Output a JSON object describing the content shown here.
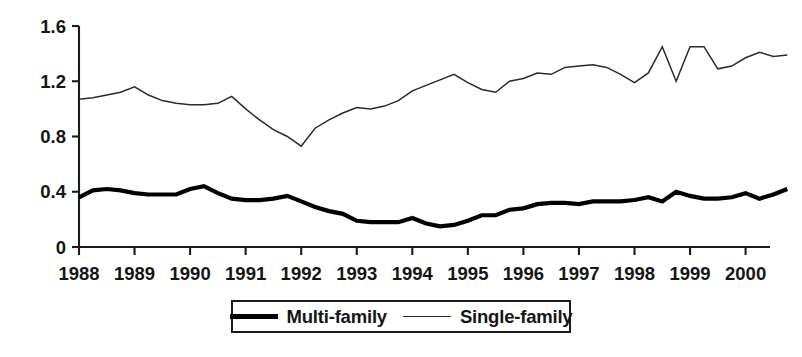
{
  "chart_data": {
    "type": "line",
    "title": "",
    "subtitle": "",
    "xlabel": "",
    "ylabel": "",
    "xlim": [
      1988.0,
      2000.75
    ],
    "ylim": [
      0,
      1.6
    ],
    "grid": false,
    "legend_position": "bottom-center",
    "x_tick_labels": [
      "1988",
      "1989",
      "1990",
      "1991",
      "1992",
      "1993",
      "1994",
      "1995",
      "1996",
      "1997",
      "1998",
      "1999",
      "2000"
    ],
    "x_tick_values": [
      1988,
      1989,
      1990,
      1991,
      1992,
      1993,
      1994,
      1995,
      1996,
      1997,
      1998,
      1999,
      2000
    ],
    "y_tick_labels": [
      "0",
      "0.4",
      "0.8",
      "1.2",
      "1.6"
    ],
    "y_tick_values": [
      0,
      0.4,
      0.8,
      1.2,
      1.6
    ],
    "x": [
      1988.0,
      1988.25,
      1988.5,
      1988.75,
      1989.0,
      1989.25,
      1989.5,
      1989.75,
      1990.0,
      1990.25,
      1990.5,
      1990.75,
      1991.0,
      1991.25,
      1991.5,
      1991.75,
      1992.0,
      1992.25,
      1992.5,
      1992.75,
      1993.0,
      1993.25,
      1993.5,
      1993.75,
      1994.0,
      1994.25,
      1994.5,
      1994.75,
      1995.0,
      1995.25,
      1995.5,
      1995.75,
      1996.0,
      1996.25,
      1996.5,
      1996.75,
      1997.0,
      1997.25,
      1997.5,
      1997.75,
      1998.0,
      1998.25,
      1998.5,
      1998.75,
      1999.0,
      1999.25,
      1999.5,
      1999.75,
      2000.0,
      2000.25,
      2000.5,
      2000.75
    ],
    "series": [
      {
        "name": "Multi-family",
        "style": "thick-black-line",
        "color": "#000000",
        "values": [
          0.36,
          0.41,
          0.42,
          0.41,
          0.39,
          0.38,
          0.38,
          0.38,
          0.42,
          0.44,
          0.39,
          0.35,
          0.34,
          0.34,
          0.35,
          0.37,
          0.33,
          0.29,
          0.26,
          0.24,
          0.19,
          0.18,
          0.18,
          0.18,
          0.21,
          0.17,
          0.15,
          0.16,
          0.19,
          0.23,
          0.23,
          0.27,
          0.28,
          0.31,
          0.32,
          0.32,
          0.31,
          0.33,
          0.33,
          0.33,
          0.34,
          0.36,
          0.33,
          0.4,
          0.37,
          0.35,
          0.35,
          0.36,
          0.39,
          0.35,
          0.38,
          0.42
        ]
      },
      {
        "name": "Single-family",
        "style": "thin-black-line",
        "color": "#2a2a2a",
        "values": [
          1.07,
          1.08,
          1.1,
          1.12,
          1.16,
          1.1,
          1.06,
          1.04,
          1.03,
          1.03,
          1.04,
          1.09,
          1.0,
          0.92,
          0.85,
          0.8,
          0.73,
          0.86,
          0.92,
          0.97,
          1.01,
          1.0,
          1.02,
          1.06,
          1.13,
          1.17,
          1.21,
          1.25,
          1.19,
          1.14,
          1.12,
          1.2,
          1.22,
          1.26,
          1.25,
          1.3,
          1.31,
          1.32,
          1.3,
          1.25,
          1.19,
          1.26,
          1.45,
          1.2,
          1.45,
          1.45,
          1.29,
          1.31,
          1.37,
          1.41,
          1.38,
          1.39
        ]
      }
    ]
  },
  "legend": {
    "items": [
      {
        "label": "Multi-family",
        "marker": "thick-line-swatch"
      },
      {
        "label": "Single-family",
        "marker": "thin-line-swatch"
      }
    ]
  }
}
